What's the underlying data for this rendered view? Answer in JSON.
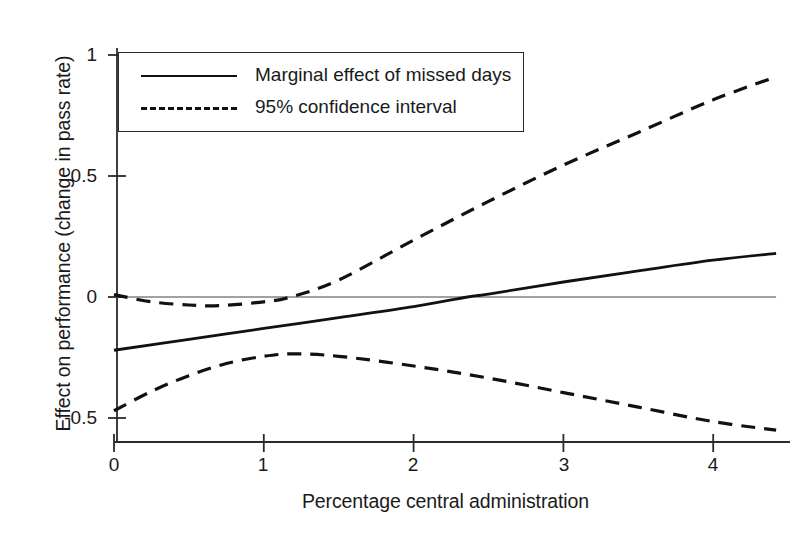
{
  "chart_data": {
    "type": "line",
    "title": "",
    "xlabel": "Percentage central administration",
    "ylabel": "Effect on performance (change in pass rate)",
    "xlim": [
      -0.1,
      4.42
    ],
    "ylim": [
      -0.62,
      1.08
    ],
    "xticks": [
      0,
      1,
      2,
      3,
      4
    ],
    "xtick_labels": [
      "0",
      "1",
      "2",
      "3",
      "4"
    ],
    "yticks": [
      1,
      0.5,
      0,
      -0.5
    ],
    "ytick_labels": [
      "1",
      "0.5",
      "0",
      "-0.5"
    ],
    "grid": false,
    "zero_line": 0,
    "legend_position": "top-left",
    "series": [
      {
        "name": "Marginal effect of missed days",
        "style": "solid",
        "color": "#111111",
        "x": [
          0,
          0.5,
          1,
          1.5,
          2,
          2.36,
          2.5,
          3,
          3.5,
          4,
          4.42
        ],
        "values": [
          -0.22,
          -0.175,
          -0.13,
          -0.085,
          -0.04,
          0.0,
          0.012,
          0.062,
          0.108,
          0.152,
          0.18
        ]
      },
      {
        "name": "95% confidence interval (upper)",
        "style": "dashed",
        "color": "#111111",
        "x": [
          0,
          0.25,
          0.5,
          0.7,
          1,
          1.18,
          1.5,
          2,
          2.5,
          3,
          3.5,
          4,
          4.42
        ],
        "values": [
          0.01,
          -0.02,
          -0.033,
          -0.036,
          -0.02,
          0.0,
          0.07,
          0.235,
          0.395,
          0.545,
          0.68,
          0.815,
          0.91
        ]
      },
      {
        "name": "95% confidence interval (lower)",
        "style": "dashed",
        "color": "#111111",
        "x": [
          0,
          0.25,
          0.5,
          0.75,
          1,
          1.2,
          1.5,
          2,
          2.5,
          3,
          3.5,
          4,
          4.42
        ],
        "values": [
          -0.47,
          -0.39,
          -0.325,
          -0.275,
          -0.245,
          -0.235,
          -0.245,
          -0.285,
          -0.335,
          -0.395,
          -0.455,
          -0.515,
          -0.55
        ]
      }
    ],
    "legend": [
      {
        "label": "Marginal effect of missed days",
        "style": "solid"
      },
      {
        "label": "95% confidence interval",
        "style": "dashed"
      }
    ]
  },
  "axes": {
    "x_tick_0": "0",
    "x_tick_1": "1",
    "x_tick_2": "2",
    "x_tick_3": "3",
    "x_tick_4": "4",
    "y_tick_0": "1",
    "y_tick_1": "0.5",
    "y_tick_2": "0",
    "y_tick_3": "-0.5"
  },
  "colors": {
    "line": "#111111",
    "axis": "#2a2a2a",
    "background": "#ffffff"
  }
}
